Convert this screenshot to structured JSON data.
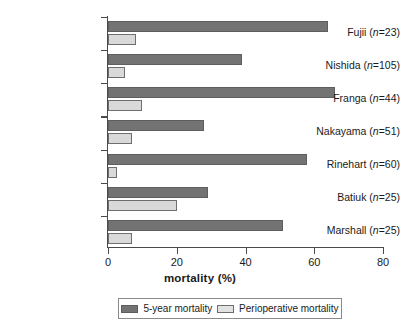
{
  "chart_data": {
    "type": "bar",
    "orientation": "horizontal",
    "title": "",
    "xlabel": "mortality (%)",
    "ylabel": "",
    "xlim": [
      0,
      80
    ],
    "xticks": [
      0,
      20,
      40,
      60,
      80
    ],
    "grid": false,
    "legend_position": "bottom",
    "categories": [
      "Fujii (n=23)",
      "Nishida (n=105)",
      "Franga (n=44)",
      "Nakayama (n=51)",
      "Rinehart (n=60)",
      "Batiuk (n=25)",
      "Marshall (n=25)"
    ],
    "category_parts": [
      {
        "name": "Fujii",
        "n": "23"
      },
      {
        "name": "Nishida",
        "n": "105"
      },
      {
        "name": "Franga",
        "n": "44"
      },
      {
        "name": "Nakayama",
        "n": "51"
      },
      {
        "name": "Rinehart",
        "n": "60"
      },
      {
        "name": "Batiuk",
        "n": "25"
      },
      {
        "name": "Marshall",
        "n": "25"
      }
    ],
    "series": [
      {
        "name": "5-year mortality",
        "color": "#737373",
        "values": [
          64,
          39,
          66,
          28,
          58,
          29,
          51
        ]
      },
      {
        "name": "Perioperative mortality",
        "color": "#d9d9d9",
        "values": [
          8,
          5,
          10,
          7,
          2.5,
          20,
          7
        ]
      }
    ]
  },
  "axis": {
    "x_title": "mortality (%)",
    "tick_labels": [
      "0",
      "20",
      "40",
      "60",
      "80"
    ]
  },
  "legend": {
    "entries": [
      {
        "label": "5-year mortality",
        "swatch": "dark"
      },
      {
        "label": "Perioperative mortality",
        "swatch": "light"
      }
    ]
  }
}
